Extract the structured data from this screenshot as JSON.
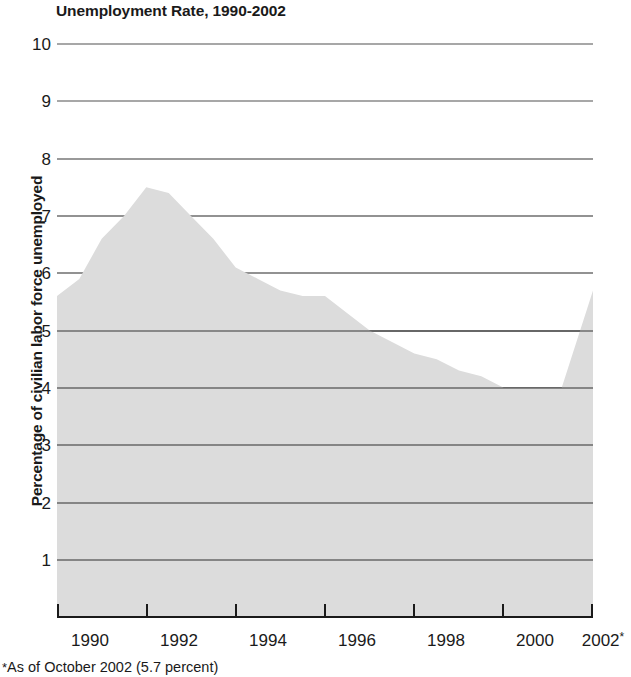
{
  "chart_data": {
    "type": "area",
    "title": "Unemployment Rate, 1990-2002",
    "xlabel": "",
    "ylabel": "Percentage of civilian labor force unemployed",
    "xlim": [
      1990,
      2002
    ],
    "ylim": [
      0,
      10
    ],
    "grid": true,
    "legend": "none",
    "series_name": "Unemployment rate",
    "x_tick_labels": [
      "1990",
      "1992",
      "1994",
      "1996",
      "1998",
      "2000",
      "2002"
    ],
    "x_tick_suffix_last": "*",
    "y_tick_labels": [
      "1",
      "2",
      "3",
      "4",
      "5",
      "6",
      "7",
      "8",
      "9",
      "10"
    ],
    "y_ticks": [
      1,
      2,
      3,
      4,
      5,
      6,
      7,
      8,
      9,
      10
    ],
    "footnote": "As of October 2002 (5.7 percent)",
    "footnote_marker": "*",
    "fill_color": "#dcdcdc",
    "gridline_color": "#6e6e6e",
    "axis_color": "#1a1a1a",
    "x": [
      1990.0,
      1990.5,
      1991.0,
      1991.5,
      1992.0,
      1992.5,
      1993.0,
      1993.5,
      1994.0,
      1994.5,
      1995.0,
      1995.5,
      1996.0,
      1996.5,
      1997.0,
      1997.5,
      1998.0,
      1998.5,
      1999.0,
      1999.5,
      2000.0,
      2000.5,
      2001.0,
      2001.3,
      2002.0
    ],
    "values": [
      5.6,
      5.9,
      6.6,
      7.0,
      7.5,
      7.4,
      7.0,
      6.6,
      6.1,
      5.9,
      5.7,
      5.6,
      5.6,
      5.3,
      5.0,
      4.8,
      4.6,
      4.5,
      4.3,
      4.2,
      4.0,
      4.0,
      4.0,
      4.0,
      5.7
    ]
  },
  "axis": {
    "y_label": "Percentage of civilian labor force unemployed"
  }
}
